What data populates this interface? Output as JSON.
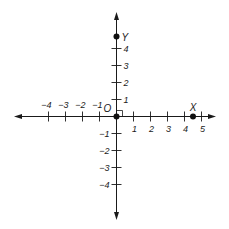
{
  "diagram": {
    "title": "",
    "type": "cartesian-coordinate-plane",
    "colors": {
      "axis": "#1a1a1a",
      "point": "#111111",
      "text": "#1a1a1a",
      "background": "#ffffff"
    },
    "x_axis": {
      "ticks": [
        {
          "value": -4,
          "label": "−4"
        },
        {
          "value": -3,
          "label": "−3"
        },
        {
          "value": -2,
          "label": "−2"
        },
        {
          "value": -1,
          "label": "−1"
        },
        {
          "value": 1,
          "label": "1"
        },
        {
          "value": 2,
          "label": "2"
        },
        {
          "value": 3,
          "label": "3"
        },
        {
          "value": 4,
          "label": "4"
        },
        {
          "value": 5,
          "label": "5"
        }
      ],
      "arrows": "both"
    },
    "y_axis": {
      "ticks": [
        {
          "value": 4,
          "label": "4"
        },
        {
          "value": 3,
          "label": "3"
        },
        {
          "value": 2,
          "label": "2"
        },
        {
          "value": 1,
          "label": "1"
        },
        {
          "value": -1,
          "label": "−1"
        },
        {
          "value": -2,
          "label": "−2"
        },
        {
          "value": -3,
          "label": "−3"
        },
        {
          "value": -4,
          "label": "−4"
        }
      ],
      "arrows": "both"
    },
    "origin": {
      "label": "O",
      "right_angle_marker": true
    },
    "points": [
      {
        "name": "origin",
        "label": "",
        "x": 0,
        "y": 0
      },
      {
        "name": "X",
        "label": "X",
        "x": 4.5,
        "y": 0
      },
      {
        "name": "Y",
        "label": "Y",
        "x": 0,
        "y": 4.7
      }
    ]
  }
}
